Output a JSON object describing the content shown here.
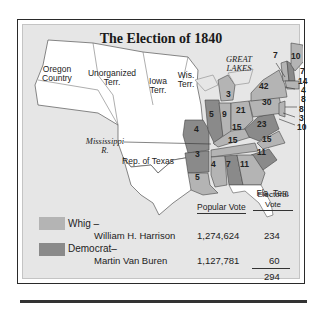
{
  "title": "The Election of 1840",
  "colors": {
    "whig": "#b4b4b4",
    "democrat": "#8a8a8a",
    "unorganized": "#ffffff",
    "background": "#e6e6e6"
  },
  "map_labels": {
    "oregon": "Oregon Country",
    "unorganized": "Unorganized Terr.",
    "iowa": "Iowa Terr.",
    "wisconsin": "Wis. Terr.",
    "great_lakes": "GREAT LAKES",
    "mississippi": "Mississippi R.",
    "texas": "Rep. of Texas",
    "florida": "Fla. Terr."
  },
  "electoral_votes": [
    {
      "state": "Maine",
      "votes": "10",
      "party": "whig"
    },
    {
      "state": "Vermont",
      "votes": "7",
      "party": "whig"
    },
    {
      "state": "New Hampshire",
      "votes": "7",
      "party": "democrat"
    },
    {
      "state": "Massachusetts",
      "votes": "14",
      "party": "whig"
    },
    {
      "state": "Rhode Island",
      "votes": "4",
      "party": "whig"
    },
    {
      "state": "Connecticut",
      "votes": "8",
      "party": "whig"
    },
    {
      "state": "New York",
      "votes": "42",
      "party": "whig"
    },
    {
      "state": "Pennsylvania",
      "votes": "30",
      "party": "whig"
    },
    {
      "state": "New Jersey",
      "votes": "8",
      "party": "whig"
    },
    {
      "state": "Delaware",
      "votes": "3",
      "party": "whig"
    },
    {
      "state": "Maryland",
      "votes": "10",
      "party": "whig"
    },
    {
      "state": "Michigan",
      "votes": "3",
      "party": "whig"
    },
    {
      "state": "Ohio",
      "votes": "21",
      "party": "whig"
    },
    {
      "state": "Indiana",
      "votes": "9",
      "party": "whig"
    },
    {
      "state": "Illinois",
      "votes": "5",
      "party": "democrat"
    },
    {
      "state": "Missouri",
      "votes": "4",
      "party": "democrat"
    },
    {
      "state": "Kentucky",
      "votes": "15",
      "party": "whig"
    },
    {
      "state": "Virginia",
      "votes": "23",
      "party": "democrat"
    },
    {
      "state": "Tennessee",
      "votes": "15",
      "party": "whig"
    },
    {
      "state": "North Carolina",
      "votes": "15",
      "party": "whig"
    },
    {
      "state": "South Carolina",
      "votes": "11",
      "party": "democrat"
    },
    {
      "state": "Arkansas",
      "votes": "3",
      "party": "democrat"
    },
    {
      "state": "Louisiana",
      "votes": "5",
      "party": "whig"
    },
    {
      "state": "Mississippi",
      "votes": "4",
      "party": "whig"
    },
    {
      "state": "Alabama",
      "votes": "7",
      "party": "democrat"
    },
    {
      "state": "Georgia",
      "votes": "11",
      "party": "whig"
    }
  ],
  "results": {
    "headers": {
      "popular": "Popular Vote",
      "electoral_line1": "Electoral",
      "electoral_line2": "Vote"
    },
    "whig": {
      "party": "Whig –",
      "candidate": "William H. Harrison",
      "popular": "1,274,624",
      "electoral": "234"
    },
    "democrat": {
      "party": "Democrat–",
      "candidate": "Martin Van Buren",
      "popular": "1,127,781",
      "electoral": "60"
    },
    "total": "294"
  }
}
